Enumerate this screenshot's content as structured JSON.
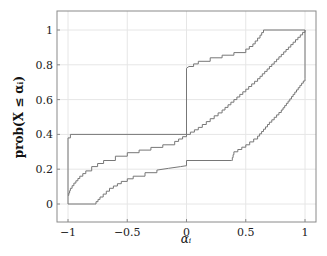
{
  "chart_data": {
    "type": "line",
    "title": "",
    "xlabel": "α_i",
    "ylabel": "prob(X ≤ α_i)",
    "xlim": [
      -1.09,
      1.09
    ],
    "ylim": [
      -0.1,
      1.1
    ],
    "grid": true,
    "legend": null,
    "xticks": [
      -1,
      -0.5,
      0,
      0.5,
      1
    ],
    "xtick_labels": [
      "−1",
      "−0.5",
      "0",
      "0.5",
      "1"
    ],
    "yticks": [
      0,
      0.2,
      0.4,
      0.6,
      0.8,
      1
    ],
    "ytick_labels": [
      "0",
      "0.2",
      "0.4",
      "0.6",
      "0.8",
      "1"
    ],
    "series": [
      {
        "name": "upper-bound",
        "x": [
          -1,
          -1,
          -0.98,
          0,
          0,
          0.02,
          0.1,
          0.2,
          0.3,
          0.4,
          0.5,
          0.56,
          0.62,
          0.65,
          1
        ],
        "y": [
          0,
          0.38,
          0.4,
          0.4,
          0.78,
          0.79,
          0.82,
          0.84,
          0.855,
          0.87,
          0.89,
          0.92,
          0.97,
          1,
          1
        ]
      },
      {
        "name": "estimate",
        "x": [
          -1,
          -0.98,
          -0.95,
          -0.9,
          -0.85,
          -0.8,
          -0.7,
          -0.6,
          -0.5,
          -0.4,
          -0.3,
          -0.2,
          -0.1,
          0,
          0.1,
          0.2,
          0.3,
          0.4,
          0.5,
          0.6,
          0.7,
          0.8,
          0.9,
          1
        ],
        "y": [
          0.05,
          0.09,
          0.12,
          0.16,
          0.19,
          0.215,
          0.25,
          0.275,
          0.295,
          0.31,
          0.325,
          0.34,
          0.36,
          0.4,
          0.44,
          0.49,
          0.54,
          0.6,
          0.66,
          0.72,
          0.79,
          0.86,
          0.93,
          1
        ]
      },
      {
        "name": "lower-bound",
        "x": [
          -1,
          -0.78,
          -0.73,
          -0.65,
          -0.55,
          -0.45,
          -0.35,
          -0.25,
          -0.15,
          -0.05,
          0,
          0,
          0.38,
          0.4,
          0.5,
          0.6,
          0.7,
          0.8,
          0.9,
          1,
          1,
          1
        ],
        "y": [
          0,
          0,
          0.04,
          0.09,
          0.13,
          0.16,
          0.18,
          0.195,
          0.205,
          0.215,
          0.22,
          0.25,
          0.25,
          0.3,
          0.34,
          0.39,
          0.47,
          0.54,
          0.63,
          0.72,
          0.72,
          1
        ]
      }
    ]
  },
  "colors": {
    "line": "#777777",
    "grid": "#e6e6e6",
    "frame": "#8a8a8a"
  }
}
